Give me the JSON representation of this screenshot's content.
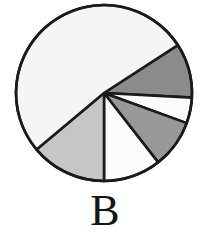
{
  "figure": {
    "label": "B",
    "caption_label": "B"
  },
  "style": {
    "stroke_color": "#1a1a1a",
    "stroke_width": 2.6,
    "background": "#ffffff",
    "label_color": "#141414"
  },
  "chart_data": {
    "type": "pie",
    "title": "B",
    "xlabel": "",
    "ylabel": "",
    "grid": false,
    "legend": "none",
    "center": [
      104,
      93
    ],
    "radius": 88,
    "start_angle_deg": -33,
    "direction": "clockwise",
    "labels": [
      "slice-1",
      "slice-2",
      "slice-3",
      "slice-4",
      "slice-5",
      "slice-6"
    ],
    "values": [
      10,
      4.7,
      8.9,
      10.6,
      13.9,
      51.9
    ],
    "angles_deg": [
      36,
      17,
      32,
      38,
      50,
      187
    ],
    "colors": [
      "#8b8b8b",
      "#fbfbfb",
      "#989898",
      "#fbfbfb",
      "#c6c6c6",
      "#f5f5f5"
    ],
    "fill_names": [
      "dark-gray",
      "white",
      "medium-gray",
      "white",
      "light-gray",
      "off-white"
    ]
  }
}
